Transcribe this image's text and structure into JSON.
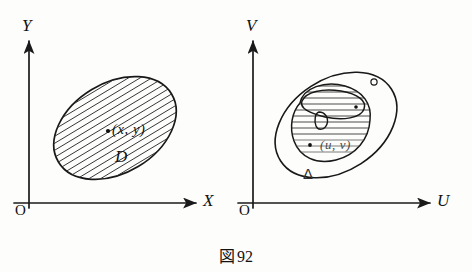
{
  "figure": {
    "caption_symbol": "図",
    "caption_number": "92",
    "caption_full": "図 92"
  },
  "panels": [
    {
      "id": "xy-plane",
      "axes": {
        "vertical_label": "Y",
        "horizontal_label": "X",
        "origin_label": "O"
      },
      "region": {
        "label": "D",
        "shading": "diagonal-hatch",
        "point_label": "(x, y)",
        "point_marker": "dot"
      }
    },
    {
      "id": "uv-plane",
      "axes": {
        "vertical_label": "V",
        "horizontal_label": "U",
        "origin_label": "O"
      },
      "region": {
        "label": "Δ",
        "shading": "horizontal-hatch",
        "point_label": "(u, v)",
        "point_marker": "dot"
      }
    }
  ],
  "colors": {
    "background": "#fdfdfc",
    "ink": "#111111",
    "faded_ink": "#4a4a4a",
    "hatch": "#2b2b2b"
  }
}
